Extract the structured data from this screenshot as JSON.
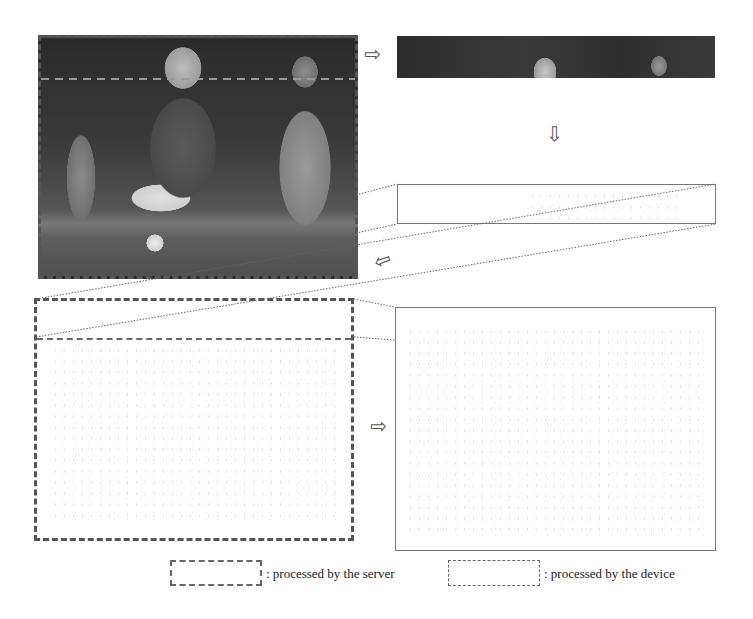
{
  "figure": {
    "panels": {
      "input_photo": {
        "label": "input-frame",
        "processed_by": "device"
      },
      "roi_strip": {
        "label": "region-of-interest-strip"
      },
      "roi_edge_strip": {
        "label": "edge-detected-strip"
      },
      "device_edge_map": {
        "label": "device-edge-map",
        "processed_by": "device"
      },
      "server_edge_map": {
        "label": "server-edge-map",
        "processed_by": "server"
      }
    },
    "arrows": {
      "right_top": "⇨",
      "down": "⇩",
      "down_left": "⇦",
      "right_bottom": "⇨"
    }
  },
  "legend": {
    "server_label": ": processed by the server",
    "device_label": ": processed by the device",
    "server_swatch": "thin-dashed",
    "device_swatch": "dashed"
  },
  "colors": {
    "dash": "#555555",
    "solid_border": "#777777",
    "background": "#ffffff"
  }
}
